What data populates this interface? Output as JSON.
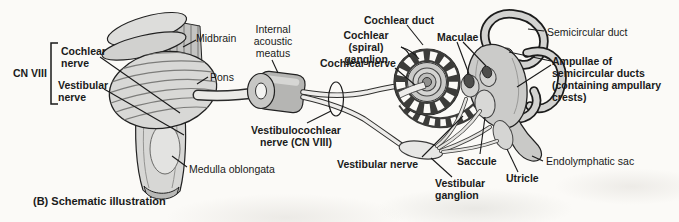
{
  "figure": {
    "type": "anatomical-schematic-of-vestibulocochlear-nerve",
    "caption": "(B) Schematic illustration",
    "colors": {
      "ink": "#1a1a1a",
      "paper": "#fbfaf7",
      "fill_light": "#d7d7d5",
      "fill_mid": "#bcbcba",
      "fill_dark": "#3c3c3a"
    },
    "labels": {
      "cn_viii": "CN VIII",
      "cochlear_nerve_brainstem": "Cochlear\nnerve",
      "vestibular_nerve_brainstem": "Vestibular\nnerve",
      "midbrain": "Midbrain",
      "pons": "Pons",
      "medulla_oblongata": "Medulla oblongata",
      "internal_acoustic_meatus": "Internal\nacoustic\nmeatus",
      "vestibulocochlear_nerve": "Vestibulocochlear\nnerve (CN VIII)",
      "cochlear_duct": "Cochlear duct",
      "cochlear_spiral_ganglion": "Cochlear\n(spiral) ganglion",
      "cochlear_nerve": "Cochlear nerve",
      "vestibular_nerve": "Vestibular nerve",
      "maculae": "Maculae",
      "semicircular_duct": "Semicircular duct",
      "ampullae": "Ampullae of\nsemicircular ducts\n(containing ampullary\ncrests)",
      "endolymphatic_sac": "Endolymphatic sac",
      "saccule": "Saccule",
      "utricle": "Utricle",
      "vestibular_ganglion": "Vestibular\nganglion"
    }
  }
}
